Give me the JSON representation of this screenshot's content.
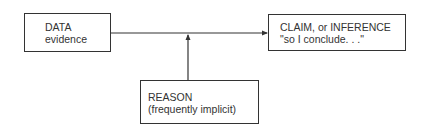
{
  "diagram": {
    "nodes": [
      {
        "id": "data",
        "line1": "DATA",
        "line2": "evidence"
      },
      {
        "id": "claim",
        "line1": "CLAIM, or INFERENCE",
        "line2": "\"so I conclude. . .\""
      },
      {
        "id": "reason",
        "line1": "REASON",
        "line2": "(frequently implicit)"
      }
    ],
    "edges": [
      {
        "from": "data",
        "to": "claim",
        "arrow": "end"
      },
      {
        "from": "reason",
        "to": "data-claim-edge",
        "arrow": "end"
      }
    ],
    "colors": {
      "line": "#333333",
      "text": "#333333",
      "background": "#ffffff"
    }
  }
}
